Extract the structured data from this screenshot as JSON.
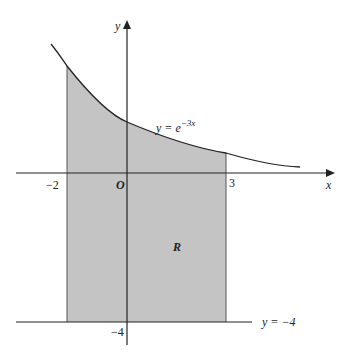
{
  "diagram": {
    "type": "region-between-curves",
    "curve": {
      "equation_prefix": "y = e",
      "exponent": "−3x"
    },
    "lower_line": {
      "label": "y = −4"
    },
    "region_label": "R",
    "axes": {
      "x_label": "x",
      "y_label": "y",
      "origin_label": "O"
    },
    "ticks": {
      "x_neg": "−2",
      "x_pos": "3",
      "y_neg": "−4"
    },
    "colors": {
      "shade": "#c4c4c4",
      "stroke": "#222222",
      "background": "#ffffff"
    }
  }
}
